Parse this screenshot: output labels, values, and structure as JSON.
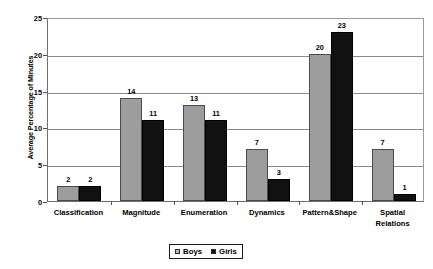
{
  "chart_data": {
    "type": "bar",
    "title": "",
    "subtitle": "",
    "xlabel": "",
    "ylabel": "Average Percentage of Minutes",
    "ylim": [
      0,
      25
    ],
    "yticks": [
      0,
      5,
      10,
      15,
      20,
      25
    ],
    "grid": true,
    "legend_position": "bottom-center",
    "categories": [
      "Classification",
      "Magnitude",
      "Enumeration",
      "Dynamics",
      "Pattern&Shape",
      "Spatial\nRelations"
    ],
    "series": [
      {
        "name": "Boys",
        "color": "#9d9d9d",
        "values": [
          2,
          14,
          13,
          7,
          20,
          7
        ]
      },
      {
        "name": "Girls",
        "color": "#111111",
        "values": [
          2,
          11,
          11,
          3,
          23,
          1
        ]
      }
    ]
  },
  "axes": {
    "y_title": "Average Percentage of Minutes",
    "y_tick_labels": [
      "0",
      "5",
      "10",
      "15",
      "20",
      "25"
    ],
    "x_tick_labels": [
      "Classification",
      "Magnitude",
      "Enumeration",
      "Dynamics",
      "Pattern&Shape",
      "Spatial\nRelations"
    ]
  },
  "legend": {
    "items": [
      {
        "label": "Boys",
        "swatch": "legend-swatch-boys"
      },
      {
        "label": "Girls",
        "swatch": "legend-swatch-girls"
      }
    ]
  },
  "value_labels": {
    "boys": [
      "2",
      "14",
      "13",
      "7",
      "20",
      "7"
    ],
    "girls": [
      "2",
      "11",
      "11",
      "3",
      "23",
      "1"
    ]
  }
}
